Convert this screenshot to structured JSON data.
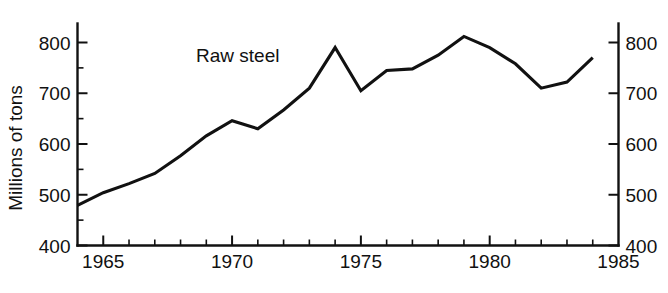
{
  "chart_data": {
    "type": "line",
    "title": "",
    "subtitle": "",
    "series_label": "Raw steel",
    "xlabel": "",
    "ylabel": "Millions of tons",
    "xlim": [
      1964,
      1985
    ],
    "ylim": [
      400,
      800
    ],
    "grid": false,
    "legend_position": "inline-annotation",
    "x_ticks_major": [
      1965,
      1970,
      1975,
      1980,
      1985
    ],
    "x_tick_labels": [
      "1965",
      "1970",
      "1975",
      "1980",
      "1985"
    ],
    "x_ticks_minor": [
      1964,
      1966,
      1967,
      1968,
      1969,
      1971,
      1972,
      1973,
      1974,
      1976,
      1977,
      1978,
      1979,
      1981,
      1982,
      1983,
      1984
    ],
    "y_ticks_major": [
      400,
      500,
      600,
      700,
      800
    ],
    "y_tick_labels_left": [
      "400",
      "500",
      "600",
      "700",
      "800"
    ],
    "y_tick_labels_right": [
      "400",
      "500",
      "600",
      "700",
      "800"
    ],
    "y_ticks_minor": [
      450,
      550,
      650,
      750
    ],
    "axis_left_labeled": true,
    "axis_right_labeled": true,
    "x": [
      1964,
      1965,
      1966,
      1967,
      1968,
      1969,
      1970,
      1971,
      1972,
      1973,
      1974,
      1975,
      1976,
      1977,
      1978,
      1979,
      1980,
      1981,
      1982,
      1983,
      1984
    ],
    "values": [
      479,
      504,
      522,
      542,
      577,
      616,
      646,
      630,
      667,
      710,
      790,
      705,
      745,
      748,
      775,
      812,
      790,
      758,
      710,
      722,
      770
    ],
    "series": [
      {
        "name": "Raw steel",
        "values": [
          479,
          504,
          522,
          542,
          577,
          616,
          646,
          630,
          667,
          710,
          790,
          705,
          745,
          748,
          775,
          812,
          790,
          758,
          710,
          722,
          770
        ]
      }
    ],
    "colors": {
      "line": "#111111",
      "axis": "#111111",
      "background": "#ffffff"
    }
  }
}
